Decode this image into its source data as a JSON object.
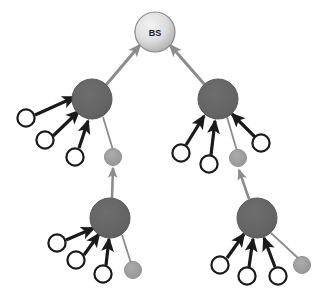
{
  "figure": {
    "background_color": "#ffffff",
    "width": 326,
    "height": 302
  },
  "legend_colors": {
    "base_station_fill_light": "#e8e8e8",
    "base_station_fill_dark": "#a9a9a9",
    "base_station_stroke": "#7a7a7a",
    "cluster_head_fill": "#636363",
    "cluster_head_stroke": "#5a5a5a",
    "member_node_fill": "#ffffff",
    "member_node_stroke": "#1a1a1a",
    "gateway_node_fill": "#9e9e9e",
    "strong_link_color": "#1a1a1a",
    "weak_link_color": "#8c8c8c"
  },
  "nodes": {
    "base_station": {
      "id": "bs",
      "label": "BS",
      "type": "base-station",
      "cx": 155,
      "cy": 32,
      "r": 20
    },
    "cluster_heads": [
      {
        "id": "ch-upper-left",
        "type": "cluster-head",
        "cx": 92,
        "cy": 99,
        "r": 20
      },
      {
        "id": "ch-upper-right",
        "type": "cluster-head",
        "cx": 218,
        "cy": 99,
        "r": 20
      },
      {
        "id": "ch-lower-left",
        "type": "cluster-head",
        "cx": 110,
        "cy": 218,
        "r": 20
      },
      {
        "id": "ch-lower-right",
        "type": "cluster-head",
        "cx": 257,
        "cy": 218,
        "r": 20
      }
    ],
    "member_nodes": [
      {
        "id": "m-ul-1",
        "cluster": "ch-upper-left",
        "cx": 26,
        "cy": 118,
        "r": 9
      },
      {
        "id": "m-ul-2",
        "cluster": "ch-upper-left",
        "cx": 45,
        "cy": 140,
        "r": 9
      },
      {
        "id": "m-ul-3",
        "cluster": "ch-upper-left",
        "cx": 75,
        "cy": 157,
        "r": 9
      },
      {
        "id": "m-ur-1",
        "cluster": "ch-upper-right",
        "cx": 181,
        "cy": 153,
        "r": 9
      },
      {
        "id": "m-ur-2",
        "cluster": "ch-upper-right",
        "cx": 209,
        "cy": 164,
        "r": 9
      },
      {
        "id": "m-ur-3",
        "cluster": "ch-upper-right",
        "cx": 261,
        "cy": 143,
        "r": 9
      },
      {
        "id": "m-ll-1",
        "cluster": "ch-lower-left",
        "cx": 57,
        "cy": 243,
        "r": 9
      },
      {
        "id": "m-ll-2",
        "cluster": "ch-lower-left",
        "cx": 76,
        "cy": 260,
        "r": 9
      },
      {
        "id": "m-ll-3",
        "cluster": "ch-lower-left",
        "cx": 103,
        "cy": 274,
        "r": 9
      },
      {
        "id": "m-lr-1",
        "cluster": "ch-lower-right",
        "cx": 220,
        "cy": 265,
        "r": 9
      },
      {
        "id": "m-lr-2",
        "cluster": "ch-lower-right",
        "cx": 247,
        "cy": 276,
        "r": 9
      },
      {
        "id": "m-lr-3",
        "cluster": "ch-lower-right",
        "cx": 278,
        "cy": 276,
        "r": 9
      }
    ],
    "gateway_nodes": [
      {
        "id": "g-ul",
        "cluster": "ch-upper-left",
        "cx": 113,
        "cy": 157,
        "r": 8
      },
      {
        "id": "g-ur",
        "cluster": "ch-upper-right",
        "cx": 238,
        "cy": 158,
        "r": 8
      },
      {
        "id": "g-ll",
        "cluster": "ch-lower-left",
        "cx": 133,
        "cy": 270,
        "r": 8
      },
      {
        "id": "g-lr",
        "cluster": "ch-lower-right",
        "cx": 302,
        "cy": 265,
        "r": 8
      }
    ]
  },
  "edges": {
    "backhaul_links": [
      {
        "id": "e-chul-bs",
        "from": "ch-upper-left",
        "to": "bs",
        "style": "weak",
        "arrow": true
      },
      {
        "id": "e-chur-bs",
        "from": "ch-upper-right",
        "to": "bs",
        "style": "weak",
        "arrow": true
      }
    ],
    "member_links": [
      {
        "id": "e-mul1",
        "from": "m-ul-1",
        "to": "ch-upper-left",
        "style": "strong",
        "arrow": true
      },
      {
        "id": "e-mul2",
        "from": "m-ul-2",
        "to": "ch-upper-left",
        "style": "strong",
        "arrow": true
      },
      {
        "id": "e-mul3",
        "from": "m-ul-3",
        "to": "ch-upper-left",
        "style": "strong",
        "arrow": true
      },
      {
        "id": "e-mur1",
        "from": "m-ur-1",
        "to": "ch-upper-right",
        "style": "strong",
        "arrow": true
      },
      {
        "id": "e-mur2",
        "from": "m-ur-2",
        "to": "ch-upper-right",
        "style": "strong",
        "arrow": true
      },
      {
        "id": "e-mur3",
        "from": "m-ur-3",
        "to": "ch-upper-right",
        "style": "strong",
        "arrow": true
      },
      {
        "id": "e-mll1",
        "from": "m-ll-1",
        "to": "ch-lower-left",
        "style": "strong",
        "arrow": true
      },
      {
        "id": "e-mll2",
        "from": "m-ll-2",
        "to": "ch-lower-left",
        "style": "strong",
        "arrow": true
      },
      {
        "id": "e-mll3",
        "from": "m-ll-3",
        "to": "ch-lower-left",
        "style": "strong",
        "arrow": true
      },
      {
        "id": "e-mlr1",
        "from": "m-lr-1",
        "to": "ch-lower-right",
        "style": "strong",
        "arrow": true
      },
      {
        "id": "e-mlr2",
        "from": "m-lr-2",
        "to": "ch-lower-right",
        "style": "strong",
        "arrow": true
      },
      {
        "id": "e-mlr3",
        "from": "m-lr-3",
        "to": "ch-lower-right",
        "style": "strong",
        "arrow": true
      }
    ],
    "gateway_links": [
      {
        "id": "e-gul-ch",
        "from": "g-ul",
        "to": "ch-upper-left",
        "style": "weak",
        "arrow": false
      },
      {
        "id": "e-gur-ch",
        "from": "g-ur",
        "to": "ch-upper-right",
        "style": "weak",
        "arrow": false
      },
      {
        "id": "e-gll-ch",
        "from": "g-ll",
        "to": "ch-lower-left",
        "style": "weak",
        "arrow": false
      },
      {
        "id": "e-glr-ch",
        "from": "g-lr",
        "to": "ch-lower-right",
        "style": "weak",
        "arrow": false
      }
    ],
    "inter_cluster_links": [
      {
        "id": "e-chll-gul",
        "from": "ch-lower-left",
        "to": "g-ul",
        "style": "weak",
        "arrow": true
      },
      {
        "id": "e-chlr-gur",
        "from": "ch-lower-right",
        "to": "g-ur",
        "style": "weak",
        "arrow": true
      }
    ]
  }
}
